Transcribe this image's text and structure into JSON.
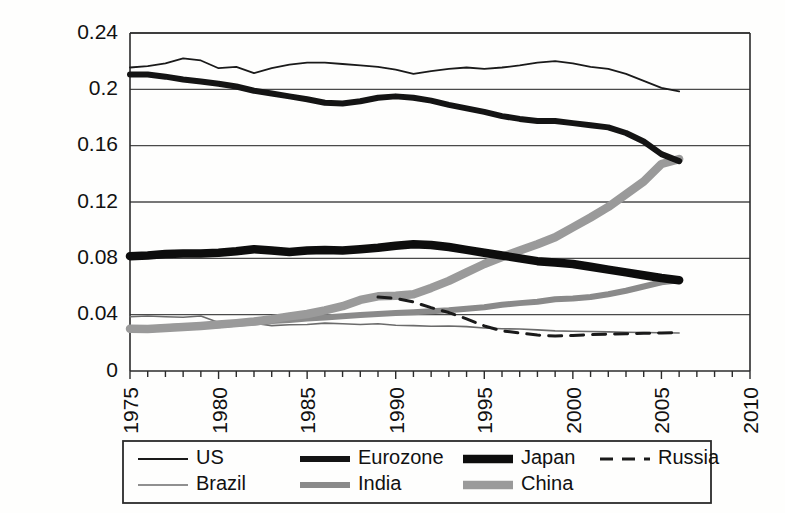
{
  "chart_data": {
    "type": "line",
    "title": "",
    "subtitle": "",
    "xlabel": "",
    "ylabel": "",
    "xlim": [
      1975,
      2010
    ],
    "ylim": [
      0,
      0.24
    ],
    "grid": true,
    "legend_position": "bottom",
    "y_ticks": [
      "0",
      "0.04",
      "0.08",
      "0.12",
      "0.16",
      "0.2",
      "0.24"
    ],
    "y_tick_values": [
      0,
      0.04,
      0.08,
      0.12,
      0.16,
      0.2,
      0.24
    ],
    "x_ticks": [
      "1975",
      "1980",
      "1985",
      "1990",
      "1995",
      "2000",
      "2005",
      "2010"
    ],
    "x_tick_values": [
      1975,
      1980,
      1985,
      1990,
      1995,
      2000,
      2005,
      2010
    ],
    "x_minor_step": 1,
    "series": [
      {
        "name": "US",
        "color": "#1a1a1a",
        "width": 1.8,
        "dash": "none",
        "x": [
          1975,
          1976,
          1977,
          1978,
          1979,
          1980,
          1981,
          1982,
          1983,
          1984,
          1985,
          1986,
          1987,
          1988,
          1989,
          1990,
          1991,
          1992,
          1993,
          1994,
          1995,
          1996,
          1997,
          1998,
          1999,
          2000,
          2001,
          2002,
          2003,
          2004,
          2005,
          2006
        ],
        "values": [
          0.2155,
          0.2165,
          0.2185,
          0.222,
          0.2205,
          0.215,
          0.216,
          0.2115,
          0.215,
          0.2175,
          0.219,
          0.219,
          0.218,
          0.217,
          0.216,
          0.214,
          0.211,
          0.213,
          0.2145,
          0.2155,
          0.2145,
          0.2155,
          0.217,
          0.219,
          0.22,
          0.2185,
          0.216,
          0.2145,
          0.211,
          0.206,
          0.201,
          0.1985
        ]
      },
      {
        "name": "Eurozone",
        "color": "#141414",
        "width": 6.0,
        "dash": "none",
        "x": [
          1975,
          1976,
          1977,
          1978,
          1979,
          1980,
          1981,
          1982,
          1983,
          1984,
          1985,
          1986,
          1987,
          1988,
          1989,
          1990,
          1991,
          1992,
          1993,
          1994,
          1995,
          1996,
          1997,
          1998,
          1999,
          2000,
          2001,
          2002,
          2003,
          2004,
          2005,
          2006
        ],
        "values": [
          0.2105,
          0.2105,
          0.209,
          0.207,
          0.2055,
          0.204,
          0.202,
          0.199,
          0.197,
          0.195,
          0.193,
          0.1905,
          0.19,
          0.1915,
          0.194,
          0.195,
          0.194,
          0.192,
          0.189,
          0.1865,
          0.184,
          0.181,
          0.179,
          0.1775,
          0.1775,
          0.176,
          0.1745,
          0.173,
          0.169,
          0.163,
          0.154,
          0.149
        ]
      },
      {
        "name": "Japan",
        "color": "#0d0d0d",
        "width": 8.5,
        "dash": "none",
        "x": [
          1975,
          1976,
          1977,
          1978,
          1979,
          1980,
          1981,
          1982,
          1983,
          1984,
          1985,
          1986,
          1987,
          1988,
          1989,
          1990,
          1991,
          1992,
          1993,
          1994,
          1995,
          1996,
          1997,
          1998,
          1999,
          2000,
          2001,
          2002,
          2003,
          2004,
          2005,
          2006
        ],
        "values": [
          0.0815,
          0.082,
          0.083,
          0.0835,
          0.0835,
          0.084,
          0.085,
          0.0865,
          0.0855,
          0.0845,
          0.0855,
          0.086,
          0.0855,
          0.0865,
          0.0875,
          0.089,
          0.09,
          0.0895,
          0.088,
          0.086,
          0.084,
          0.082,
          0.08,
          0.078,
          0.077,
          0.076,
          0.074,
          0.072,
          0.07,
          0.068,
          0.066,
          0.0645
        ]
      },
      {
        "name": "Russia",
        "color": "#1a1a1a",
        "width": 3.0,
        "dash": "13,9",
        "x": [
          1989,
          1990,
          1991,
          1992,
          1993,
          1994,
          1995,
          1996,
          1997,
          1998,
          1999,
          2000,
          2001,
          2002,
          2003,
          2004,
          2005,
          2006
        ],
        "values": [
          0.0525,
          0.0515,
          0.049,
          0.045,
          0.0415,
          0.037,
          0.032,
          0.0285,
          0.027,
          0.0255,
          0.0248,
          0.0252,
          0.0258,
          0.0262,
          0.0265,
          0.0268,
          0.027,
          0.0272
        ]
      },
      {
        "name": "Brazil",
        "color": "#6b6b6b",
        "width": 1.6,
        "dash": "none",
        "x": [
          1975,
          1976,
          1977,
          1978,
          1979,
          1980,
          1981,
          1982,
          1983,
          1984,
          1985,
          1986,
          1987,
          1988,
          1989,
          1990,
          1991,
          1992,
          1993,
          1994,
          1995,
          1996,
          1997,
          1998,
          1999,
          2000,
          2001,
          2002,
          2003,
          2004,
          2005,
          2006
        ],
        "values": [
          0.0385,
          0.039,
          0.0385,
          0.0382,
          0.039,
          0.0345,
          0.0345,
          0.034,
          0.0322,
          0.0328,
          0.033,
          0.034,
          0.0335,
          0.033,
          0.0335,
          0.0325,
          0.0322,
          0.0318,
          0.032,
          0.0315,
          0.0305,
          0.03,
          0.0298,
          0.0292,
          0.0285,
          0.0282,
          0.028,
          0.0278,
          0.0275,
          0.0273,
          0.0272,
          0.027
        ]
      },
      {
        "name": "India",
        "color": "#8a8a8a",
        "width": 6.0,
        "dash": "none",
        "x": [
          1975,
          1976,
          1977,
          1978,
          1979,
          1980,
          1981,
          1982,
          1983,
          1984,
          1985,
          1986,
          1987,
          1988,
          1989,
          1990,
          1991,
          1992,
          1993,
          1994,
          1995,
          1996,
          1997,
          1998,
          1999,
          2000,
          2001,
          2002,
          2003,
          2004,
          2005,
          2006
        ],
        "values": [
          0.03,
          0.03,
          0.031,
          0.0318,
          0.032,
          0.0325,
          0.0335,
          0.0345,
          0.0355,
          0.0362,
          0.0372,
          0.038,
          0.0388,
          0.0398,
          0.0405,
          0.0412,
          0.0418,
          0.0425,
          0.0432,
          0.0442,
          0.0452,
          0.047,
          0.0482,
          0.0492,
          0.051,
          0.0515,
          0.0525,
          0.0545,
          0.057,
          0.06,
          0.063,
          0.0645
        ]
      },
      {
        "name": "China",
        "color": "#9a9a9a",
        "width": 8.5,
        "dash": "none",
        "x": [
          1975,
          1976,
          1977,
          1978,
          1979,
          1980,
          1981,
          1982,
          1983,
          1984,
          1985,
          1986,
          1987,
          1988,
          1989,
          1990,
          1991,
          1992,
          1993,
          1994,
          1995,
          1996,
          1997,
          1998,
          1999,
          2000,
          2001,
          2002,
          2003,
          2004,
          2005,
          2006
        ],
        "values": [
          0.03,
          0.0298,
          0.0305,
          0.0312,
          0.032,
          0.033,
          0.034,
          0.0352,
          0.0368,
          0.0388,
          0.0405,
          0.043,
          0.046,
          0.0505,
          0.053,
          0.0535,
          0.0545,
          0.059,
          0.064,
          0.07,
          0.076,
          0.081,
          0.0855,
          0.09,
          0.095,
          0.102,
          0.109,
          0.1165,
          0.1255,
          0.1345,
          0.147,
          0.1505
        ]
      }
    ]
  },
  "legend": {
    "entries": [
      {
        "label": "US"
      },
      {
        "label": "Eurozone"
      },
      {
        "label": "Japan"
      },
      {
        "label": "Russia"
      },
      {
        "label": "Brazil"
      },
      {
        "label": "India"
      },
      {
        "label": "China"
      }
    ]
  }
}
